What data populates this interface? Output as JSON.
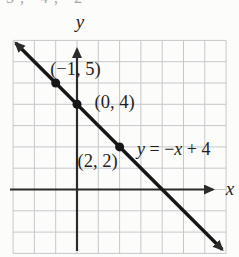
{
  "cropped_top_text": "5, 4, 2",
  "chart_data": {
    "type": "line",
    "equation_label": "y = −x + 4",
    "line": {
      "slope": -1,
      "y_intercept": 4
    },
    "points": [
      {
        "x": -1,
        "y": 5,
        "label": "(−1, 5)"
      },
      {
        "x": 0,
        "y": 4,
        "label": "(0, 4)"
      },
      {
        "x": 2,
        "y": 2,
        "label": "(2, 2)"
      }
    ],
    "xlabel": "x",
    "ylabel": "y",
    "xlim": [
      -3,
      7
    ],
    "ylim": [
      -3,
      7
    ],
    "grid": true,
    "legend": "none",
    "colors": {
      "background": "#fcfcfa",
      "grid": "#c5c8cb",
      "axis": "#2b2b2b",
      "line": "#161616",
      "text": "#1e1e1e"
    }
  }
}
